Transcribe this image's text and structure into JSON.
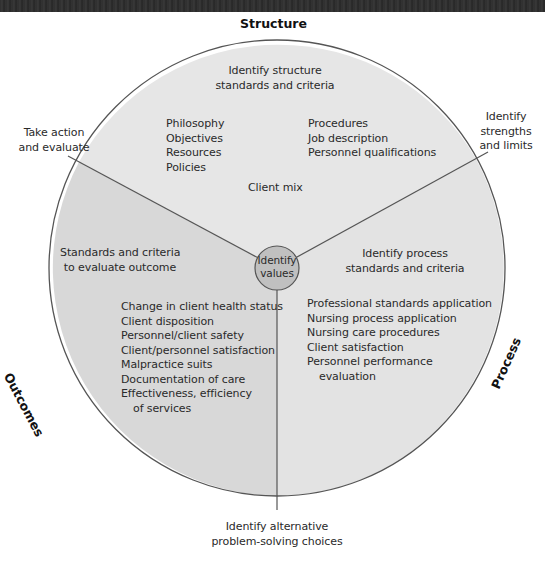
{
  "diagram": {
    "type": "circular-segmented-model",
    "colors": {
      "structure_fill": "#e6e6e6",
      "outcomes_fill": "#d8d8d8",
      "process_fill": "#e3e3e3",
      "center_fill": "#c0c0c0",
      "stroke": "#555555"
    },
    "segments": {
      "structure": {
        "title": "Structure",
        "heading": [
          "Identify structure",
          "standards and criteria"
        ],
        "items_left": [
          "Philosophy",
          "Objectives",
          "Resources",
          "Policies"
        ],
        "items_right": [
          "Procedures",
          "Job description",
          "Personnel qualifications"
        ],
        "footer": "Client mix"
      },
      "outcomes": {
        "title": "Outcomes",
        "heading": [
          "Standards and criteria",
          "to evaluate outcome"
        ],
        "items": [
          "Change in client health status",
          "Client disposition",
          "Personnel/client safety",
          "Client/personnel satisfaction",
          "Malpractice suits",
          "Documentation of care",
          "Effectiveness, efficiency",
          "of services"
        ]
      },
      "process": {
        "title": "Process",
        "heading": [
          "Identify process",
          "standards and criteria"
        ],
        "items": [
          "Professional standards application",
          "Nursing process application",
          "Nursing care procedures",
          "Client satisfaction",
          "Personnel performance",
          "evaluation"
        ]
      }
    },
    "center": [
      "Identify",
      "values"
    ],
    "external_labels": {
      "top_left": [
        "Take action",
        "and evaluate"
      ],
      "top_right": [
        "Identify",
        "strengths",
        "and limits"
      ],
      "bottom": [
        "Identify alternative",
        "problem-solving choices"
      ]
    }
  }
}
